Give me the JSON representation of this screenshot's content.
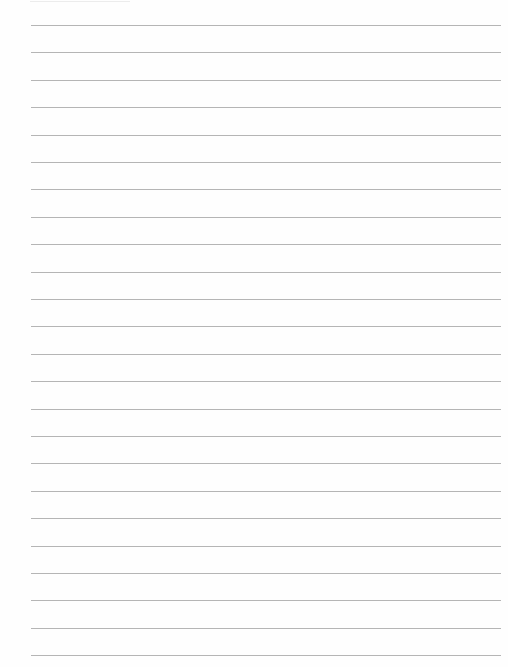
{
  "page": {
    "type": "ruled-paper",
    "line_color": "#a8a8a8",
    "background": "#fefefe",
    "line_count": 24,
    "first_line_y": 25,
    "line_spacing": 27.4,
    "line_left": 31,
    "line_right": 501,
    "text": ""
  }
}
